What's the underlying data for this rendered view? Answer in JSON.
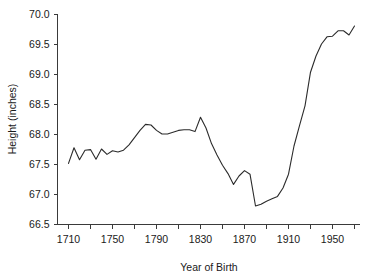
{
  "chart_data": {
    "type": "line",
    "title": "",
    "xlabel": "Year of Birth",
    "ylabel": "Height (inches)",
    "xlim": [
      1700,
      1975
    ],
    "ylim": [
      66.5,
      70.0
    ],
    "grid": false,
    "legend": false,
    "x_major_ticks": [
      1710,
      1750,
      1790,
      1830,
      1870,
      1910,
      1950
    ],
    "x_major_tick_labels": [
      "1710",
      "1750",
      "1790",
      "1830",
      "1870",
      "1910",
      "1950"
    ],
    "x_minor_ticks": [
      1730,
      1770,
      1810,
      1850,
      1890,
      1930,
      1970
    ],
    "y_ticks": [
      66.5,
      67.0,
      67.5,
      68.0,
      68.5,
      69.0,
      69.5,
      70.0
    ],
    "y_tick_labels": [
      "66.5",
      "67.0",
      "67.5",
      "68.0",
      "68.5",
      "69.0",
      "69.5",
      "70.0"
    ],
    "series": [
      {
        "name": "Mean height at age 21",
        "color": "#2b2b2b",
        "x": [
          1710,
          1715,
          1720,
          1725,
          1730,
          1735,
          1740,
          1745,
          1750,
          1755,
          1760,
          1765,
          1770,
          1775,
          1780,
          1785,
          1790,
          1795,
          1800,
          1805,
          1810,
          1815,
          1820,
          1825,
          1830,
          1835,
          1840,
          1845,
          1850,
          1855,
          1860,
          1865,
          1870,
          1875,
          1880,
          1885,
          1890,
          1895,
          1900,
          1905,
          1910,
          1915,
          1920,
          1925,
          1930,
          1935,
          1940,
          1945,
          1950,
          1955,
          1960,
          1965,
          1970
        ],
        "values": [
          67.51,
          67.77,
          67.57,
          67.73,
          67.74,
          67.58,
          67.75,
          67.66,
          67.72,
          67.7,
          67.73,
          67.82,
          67.94,
          68.06,
          68.16,
          68.15,
          68.06,
          68.0,
          68.0,
          68.03,
          68.06,
          68.07,
          68.07,
          68.04,
          68.28,
          68.1,
          67.84,
          67.65,
          67.48,
          67.34,
          67.16,
          67.3,
          67.39,
          67.33,
          66.8,
          66.83,
          66.88,
          66.92,
          66.96,
          67.1,
          67.33,
          67.8,
          68.14,
          68.47,
          69.03,
          69.3,
          69.5,
          69.62,
          69.63,
          69.72,
          69.72,
          69.65,
          69.8
        ]
      }
    ]
  },
  "axes": {
    "x_title": "Year of Birth",
    "y_title": "Height (inches)"
  }
}
